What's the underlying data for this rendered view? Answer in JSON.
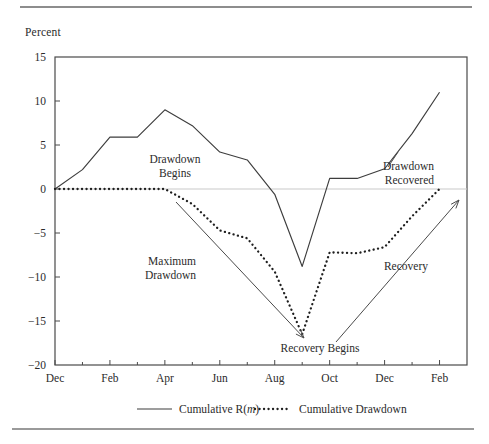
{
  "figure": {
    "y_axis_title": "Percent",
    "top_rule": "horizontal-rule",
    "bottom_rule": "horizontal-rule"
  },
  "chart_data": {
    "type": "line",
    "title": "",
    "subtitle": "",
    "xlabel": "",
    "ylabel": "Percent",
    "ylim": [
      -20,
      15
    ],
    "xlim": [
      0,
      15
    ],
    "grid": false,
    "zero_line": true,
    "legend_position": "below-axes",
    "y_ticks": [
      "15",
      "10",
      "5",
      "0",
      "-5",
      "-10",
      "-15",
      "-20"
    ],
    "y_tick_values": [
      15,
      10,
      5,
      0,
      -5,
      -10,
      -15,
      -20
    ],
    "x_ticks": [
      "Dec",
      "Feb",
      "Apr",
      "Jun",
      "Aug",
      "Oct",
      "Dec",
      "Feb"
    ],
    "x_tick_positions": [
      0,
      2,
      4,
      6,
      8,
      10,
      12,
      14
    ],
    "x_minor_positions": [
      1,
      3,
      5,
      7,
      9,
      11,
      13,
      15
    ],
    "months": [
      "Dec",
      "Jan",
      "Feb",
      "Mar",
      "Apr",
      "May",
      "Jun",
      "Jul",
      "Aug",
      "Sep",
      "Oct",
      "Nov",
      "Dec",
      "Jan",
      "Feb"
    ],
    "series": [
      {
        "name": "Cumulative R(m)",
        "style": "solid",
        "color": "#3d3d3d",
        "x": [
          0,
          1,
          2,
          3,
          4,
          5,
          6,
          7,
          8,
          9,
          10,
          11,
          12,
          13,
          14
        ],
        "values": [
          0.0,
          2.2,
          5.9,
          5.9,
          9.0,
          7.2,
          4.2,
          3.3,
          -0.6,
          -8.8,
          1.2,
          1.2,
          2.3,
          6.3,
          11.0
        ]
      },
      {
        "name": "Cumulative Drawdown",
        "style": "dotted",
        "color": "#1f1f1f",
        "x": [
          0,
          1,
          2,
          3,
          4,
          5,
          6,
          7,
          8,
          9,
          10,
          11,
          12,
          13,
          14
        ],
        "values": [
          0.0,
          0.0,
          0.0,
          0.0,
          0.0,
          -1.7,
          -4.7,
          -5.6,
          -9.4,
          -16.5,
          -7.2,
          -7.3,
          -6.6,
          -3.1,
          0.0
        ]
      }
    ],
    "annotations": [
      {
        "name": "drawdown-begins",
        "text_lines": [
          "Drawdown",
          "Begins"
        ],
        "text_x": 175,
        "text_y": 163,
        "has_arrow": false
      },
      {
        "name": "maximum-drawdown",
        "text_lines": [
          "Maximum",
          "Drawdown"
        ],
        "text_x": 196,
        "text_y": 265,
        "has_arrow": true,
        "arrow_from": [
          176,
          202
        ],
        "arrow_to": [
          304,
          338
        ]
      },
      {
        "name": "recovery-begins",
        "text_lines": [
          "Recovery Begins"
        ],
        "text_x": 320,
        "text_y": 352,
        "has_arrow": false
      },
      {
        "name": "recovery",
        "text_lines": [
          "Recovery"
        ],
        "text_x": 428,
        "text_y": 270,
        "has_arrow": true,
        "arrow_from": [
          336,
          342
        ],
        "arrow_to": [
          459,
          200
        ]
      },
      {
        "name": "drawdown-recovered",
        "text_lines": [
          "Drawdown",
          "Recovered"
        ],
        "text_x": 434,
        "text_y": 170,
        "has_arrow": false
      }
    ],
    "legend": [
      {
        "label": "Cumulative R(",
        "label_italic": "m",
        "label_tail": ")",
        "style": "solid"
      },
      {
        "label": "Cumulative Drawdown",
        "label_italic": "",
        "label_tail": "",
        "style": "dotted"
      }
    ]
  },
  "legend_labels": {
    "series1_prefix": "Cumulative R(",
    "series1_italic": "m",
    "series1_suffix": ")",
    "series2": "Cumulative Drawdown"
  },
  "ticks": {
    "y": [
      "15",
      "10",
      "5",
      "0",
      "-5",
      "-10",
      "-15",
      "-20"
    ],
    "x": [
      "Dec",
      "Feb",
      "Apr",
      "Jun",
      "Aug",
      "Oct",
      "Dec",
      "Feb"
    ]
  },
  "annotation_text": {
    "drawdown_begins_1": "Drawdown",
    "drawdown_begins_2": "Begins",
    "maximum_drawdown_1": "Maximum",
    "maximum_drawdown_2": "Drawdown",
    "recovery_begins": "Recovery Begins",
    "recovery": "Recovery",
    "drawdown_recovered_1": "Drawdown",
    "drawdown_recovered_2": "Recovered"
  }
}
